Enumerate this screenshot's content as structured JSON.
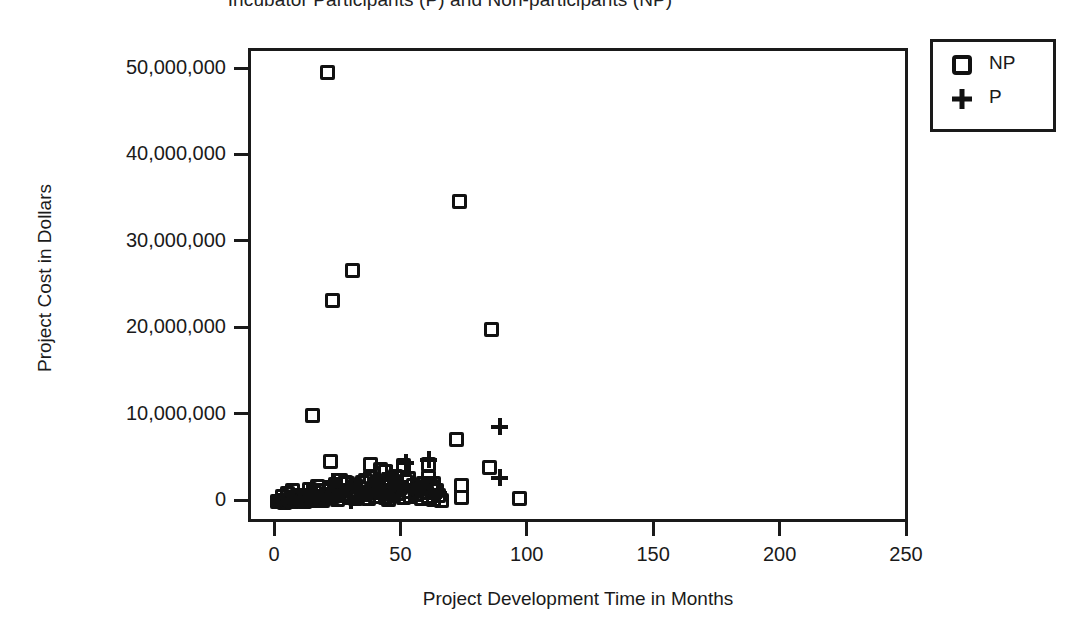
{
  "chart_data": {
    "type": "scatter",
    "title": "Incubator Participants (P) and Non-participants (NP)",
    "xlabel": "Project Development Time in Months",
    "ylabel": "Project Cost in Dollars",
    "xlim": [
      0,
      250
    ],
    "ylim": [
      0,
      52000000
    ],
    "xticks": [
      0,
      50,
      100,
      150,
      200,
      250
    ],
    "xticklabels": [
      "0",
      "50",
      "100",
      "150",
      "200",
      "250"
    ],
    "yticks": [
      0,
      10000000,
      20000000,
      30000000,
      40000000,
      50000000
    ],
    "yticklabels": [
      "0",
      "10,000,000",
      "20,000,000",
      "30,000,000",
      "40,000,000",
      "50,000,000"
    ],
    "grid": false,
    "legend_position": "outside-top-right",
    "marker_color": "#111111",
    "series": [
      {
        "name": "NP",
        "marker": "open-square",
        "points": [
          [
            20,
            49800000
          ],
          [
            22,
            23400000
          ],
          [
            30,
            26900000
          ],
          [
            72,
            34900000
          ],
          [
            85,
            20100000
          ],
          [
            14,
            10100000
          ],
          [
            71,
            7400000
          ],
          [
            21,
            4800000
          ],
          [
            37,
            4500000
          ],
          [
            41,
            3900000
          ],
          [
            43,
            3600000
          ],
          [
            50,
            4300000
          ],
          [
            60,
            4400000
          ],
          [
            60,
            2900000
          ],
          [
            84,
            4100000
          ],
          [
            73,
            2000000
          ],
          [
            73,
            600000
          ],
          [
            96,
            500000
          ],
          [
            0,
            200000
          ],
          [
            1,
            150000
          ],
          [
            2,
            300000
          ],
          [
            3,
            100000
          ],
          [
            4,
            250000
          ],
          [
            5,
            400000
          ],
          [
            6,
            200000
          ],
          [
            7,
            600000
          ],
          [
            8,
            350000
          ],
          [
            9,
            500000
          ],
          [
            10,
            250000
          ],
          [
            11,
            700000
          ],
          [
            12,
            400000
          ],
          [
            13,
            900000
          ],
          [
            14,
            300000
          ],
          [
            15,
            1200000
          ],
          [
            16,
            500000
          ],
          [
            17,
            800000
          ],
          [
            18,
            1500000
          ],
          [
            19,
            600000
          ],
          [
            20,
            1000000
          ],
          [
            21,
            1800000
          ],
          [
            22,
            700000
          ],
          [
            23,
            2100000
          ],
          [
            24,
            1100000
          ],
          [
            24,
            400000
          ],
          [
            25,
            2600000
          ],
          [
            26,
            900000
          ],
          [
            27,
            1500000
          ],
          [
            28,
            2200000
          ],
          [
            29,
            600000
          ],
          [
            30,
            1300000
          ],
          [
            31,
            2000000
          ],
          [
            32,
            800000
          ],
          [
            33,
            1700000
          ],
          [
            34,
            2400000
          ],
          [
            35,
            1000000
          ],
          [
            36,
            500000
          ],
          [
            37,
            2900000
          ],
          [
            38,
            1400000
          ],
          [
            39,
            700000
          ],
          [
            40,
            2100000
          ],
          [
            41,
            1200000
          ],
          [
            42,
            1900000
          ],
          [
            43,
            600000
          ],
          [
            44,
            2700000
          ],
          [
            45,
            1500000
          ],
          [
            46,
            900000
          ],
          [
            47,
            2300000
          ],
          [
            48,
            1100000
          ],
          [
            49,
            1800000
          ],
          [
            50,
            600000
          ],
          [
            51,
            2500000
          ],
          [
            52,
            1300000
          ],
          [
            53,
            800000
          ],
          [
            54,
            2000000
          ],
          [
            55,
            1000000
          ],
          [
            56,
            1600000
          ],
          [
            57,
            500000
          ],
          [
            58,
            2200000
          ],
          [
            59,
            1200000
          ],
          [
            60,
            700000
          ],
          [
            61,
            1900000
          ],
          [
            62,
            400000
          ],
          [
            63,
            1400000
          ],
          [
            64,
            900000
          ],
          [
            65,
            300000
          ],
          [
            2,
            700000
          ],
          [
            4,
            1100000
          ],
          [
            6,
            1400000
          ],
          [
            8,
            900000
          ],
          [
            11,
            200000
          ],
          [
            13,
            1600000
          ],
          [
            16,
            1900000
          ],
          [
            18,
            300000
          ],
          [
            23,
            1300000
          ],
          [
            27,
            2400000
          ],
          [
            31,
            500000
          ],
          [
            35,
            2600000
          ],
          [
            39,
            2000000
          ],
          [
            44,
            400000
          ],
          [
            47,
            3100000
          ],
          [
            52,
            2800000
          ],
          [
            57,
            1700000
          ],
          [
            62,
            2300000
          ]
        ]
      },
      {
        "name": "P",
        "marker": "plus",
        "points": [
          [
            88,
            8800000
          ],
          [
            88,
            2900000
          ],
          [
            51,
            4700000
          ],
          [
            45,
            3400000
          ],
          [
            60,
            5000000
          ],
          [
            47,
            2600000
          ],
          [
            31,
            1800000
          ],
          [
            20,
            900000
          ],
          [
            25,
            1400000
          ],
          [
            33,
            700000
          ],
          [
            38,
            2200000
          ],
          [
            42,
            1100000
          ],
          [
            55,
            1500000
          ],
          [
            62,
            800000
          ],
          [
            9,
            600000
          ],
          [
            15,
            1000000
          ],
          [
            29,
            300000
          ],
          [
            36,
            1600000
          ],
          [
            44,
            500000
          ],
          [
            58,
            2000000
          ],
          [
            5,
            400000
          ],
          [
            12,
            1300000
          ],
          [
            22,
            2500000
          ],
          [
            48,
            1900000
          ],
          [
            64,
            1200000
          ]
        ]
      }
    ]
  },
  "legend": {
    "items": [
      {
        "label": "NP",
        "marker": "open-square"
      },
      {
        "label": "P",
        "marker": "plus"
      }
    ]
  }
}
